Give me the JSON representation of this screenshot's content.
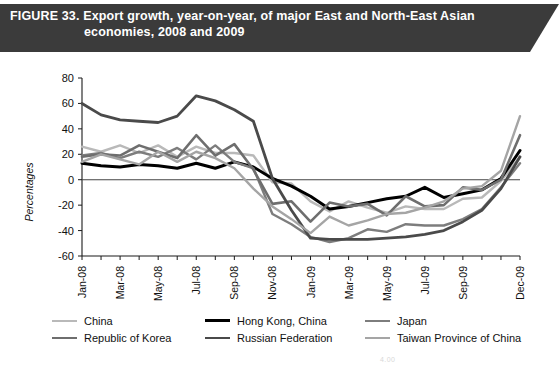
{
  "figure": {
    "title_line1": "FIGURE 33. Export growth, year-on-year, of major East and North-East Asian",
    "title_line2": "economies, 2008 and 2009",
    "banner_color": "#3b3b3b"
  },
  "footer": {
    "fragment": "4.00"
  },
  "legend": {
    "rows": [
      [
        {
          "label": "China",
          "color": "#b9b9b9",
          "width": 2.4
        },
        {
          "label": "Hong Kong, China",
          "color": "#000000",
          "width": 3.0
        },
        {
          "label": "Japan",
          "color": "#7d7d7d",
          "width": 2.4
        }
      ],
      [
        {
          "label": "Republic of Korea",
          "color": "#6e6e6e",
          "width": 2.6
        },
        {
          "label": "Russian Federation",
          "color": "#4a4a4a",
          "width": 2.8
        },
        {
          "label": "Taiwan Province of China",
          "color": "#a5a5a5",
          "width": 2.4
        }
      ]
    ]
  },
  "chart_data": {
    "type": "line",
    "title": "Export growth, year-on-year, of major East and North-East Asian economies, 2008 and 2009",
    "xlabel": "",
    "ylabel": "Percentages",
    "ylim": [
      -60,
      80
    ],
    "yticks": [
      80,
      60,
      40,
      20,
      0,
      -20,
      -40,
      -60
    ],
    "grid": false,
    "legend_position": "bottom",
    "x": [
      "Jan-08",
      "Feb-08",
      "Mar-08",
      "Apr-08",
      "May-08",
      "Jun-08",
      "Jul-08",
      "Aug-08",
      "Sep-08",
      "Oct-08",
      "Nov-08",
      "Dec-08",
      "Jan-09",
      "Feb-09",
      "Mar-09",
      "Apr-09",
      "May-09",
      "Jun-09",
      "Jul-09",
      "Aug-09",
      "Sep-09",
      "Oct-09",
      "Nov-09",
      "Dec-09"
    ],
    "xtick_labels": [
      "Jan-08",
      "Mar-08",
      "May-08",
      "Jul-08",
      "Sep-08",
      "Nov-08",
      "Jan-09",
      "Mar-09",
      "May-09",
      "Jul-09",
      "Sep-09",
      "Dec-09"
    ],
    "series": [
      {
        "name": "China",
        "color": "#b9b9b9",
        "width": 2.4,
        "values": [
          26,
          22,
          27,
          21,
          27,
          18,
          26,
          21,
          21,
          19,
          -2,
          -3,
          -17,
          -25,
          -17,
          -22,
          -26,
          -21,
          -23,
          -23,
          -15,
          -14,
          -1,
          18
        ]
      },
      {
        "name": "Hong Kong, China",
        "color": "#000000",
        "width": 3.0,
        "values": [
          13,
          11,
          10,
          12,
          11,
          9,
          13,
          9,
          14,
          10,
          1,
          -5,
          -13,
          -23,
          -21,
          -18,
          -15,
          -13,
          -6,
          -14,
          -11,
          -8,
          1,
          23
        ]
      },
      {
        "name": "Japan",
        "color": "#7d7d7d",
        "width": 2.4,
        "values": [
          19,
          21,
          17,
          22,
          18,
          25,
          16,
          27,
          14,
          9,
          -27,
          -35,
          -45,
          -49,
          -46,
          -39,
          -41,
          -35,
          -36,
          -36,
          -31,
          -23,
          -6,
          13
        ]
      },
      {
        "name": "Republic of Korea",
        "color": "#6e6e6e",
        "width": 2.6,
        "values": [
          18,
          20,
          19,
          27,
          22,
          17,
          35,
          19,
          28,
          8,
          -19,
          -17,
          -33,
          -18,
          -21,
          -19,
          -28,
          -13,
          -21,
          -20,
          -6,
          -8,
          0,
          35
        ]
      },
      {
        "name": "Russian Federation",
        "color": "#4a4a4a",
        "width": 2.8,
        "values": [
          60,
          51,
          47,
          46,
          45,
          50,
          66,
          62,
          55,
          46,
          1,
          -24,
          -46,
          -47,
          -47,
          -47,
          -46,
          -45,
          -43,
          -40,
          -33,
          -24,
          -7,
          18
        ]
      },
      {
        "name": "Taiwan Province of China",
        "color": "#a5a5a5",
        "width": 2.4,
        "values": [
          14,
          20,
          16,
          12,
          22,
          14,
          22,
          17,
          9,
          -7,
          -21,
          -31,
          -42,
          -29,
          -36,
          -32,
          -27,
          -26,
          -22,
          -17,
          -7,
          -5,
          7,
          50
        ]
      }
    ]
  }
}
